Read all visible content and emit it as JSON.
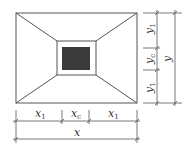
{
  "diagram": {
    "colors": {
      "line": "#555555",
      "fill": "#3a3a3a",
      "background": "#ffffff"
    },
    "horizontal_dims": {
      "segments": [
        {
          "base": "x",
          "sub": "1"
        },
        {
          "base": "x",
          "sub": "c"
        },
        {
          "base": "x",
          "sub": "1"
        }
      ],
      "total": {
        "base": "x",
        "sub": ""
      }
    },
    "vertical_dims": {
      "segments": [
        {
          "base": "y",
          "sub": "1"
        },
        {
          "base": "y",
          "sub": "c"
        },
        {
          "base": "y",
          "sub": "1"
        }
      ],
      "total": {
        "base": "y",
        "sub": ""
      }
    }
  }
}
